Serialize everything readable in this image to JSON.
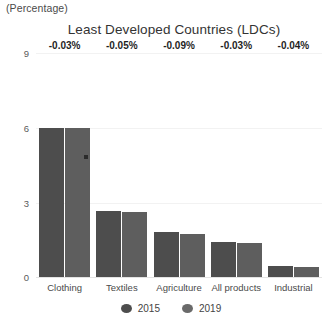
{
  "unit_label": "(Percentage)",
  "legend": {
    "position": "bottom-center",
    "items": [
      {
        "label": "2015",
        "color": "#4d4d4d"
      },
      {
        "label": "2019",
        "color": "#6a6a6a"
      }
    ]
  },
  "chart_data": {
    "type": "bar",
    "title": "Least Developed Countries (LDCs)",
    "xlabel": "",
    "ylabel": "(Percentage)",
    "ylim": [
      0,
      9
    ],
    "yticks": [
      "0",
      "3",
      "6",
      "9"
    ],
    "grid": true,
    "categories": [
      "Clothing",
      "Textiles",
      "Agriculture",
      "All products",
      "Industrial"
    ],
    "series": [
      {
        "name": "2015",
        "values": [
          6.0,
          2.65,
          1.82,
          1.39,
          0.46
        ]
      },
      {
        "name": "2019",
        "values": [
          5.97,
          2.6,
          1.73,
          1.36,
          0.42
        ]
      }
    ],
    "annotations": [
      "-0.03%",
      "-0.05%",
      "-0.09%",
      "-0.03%",
      "-0.04%"
    ]
  }
}
